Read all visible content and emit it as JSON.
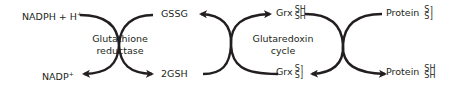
{
  "diagram": {
    "stroke_color": "#231f20",
    "labels": {
      "nadph": "NADPH + H",
      "nadph_sup": "+",
      "nadp": "NADP",
      "nadp_sup": "+",
      "gssg": "GSSG",
      "gsh": "2GSH",
      "grx_reduced_prefix": "Grx",
      "grx_reduced_top": "SH",
      "grx_reduced_bottom": "SH",
      "grx_oxidized_prefix": "Grx",
      "grx_oxidized_top": "S⌉",
      "grx_oxidized_bottom": "S⌋",
      "protein_oxidized_prefix": "Protein",
      "protein_oxidized_top": "S⌉",
      "protein_oxidized_bottom": "S⌋",
      "protein_reduced_prefix": "Protein",
      "protein_reduced_top": "SH",
      "protein_reduced_bottom": "SH"
    },
    "enzymes": {
      "left_line1": "Glutathione",
      "left_line2": "reductase",
      "middle_line1": "Glutaredoxin",
      "middle_line2": "cycle"
    }
  }
}
